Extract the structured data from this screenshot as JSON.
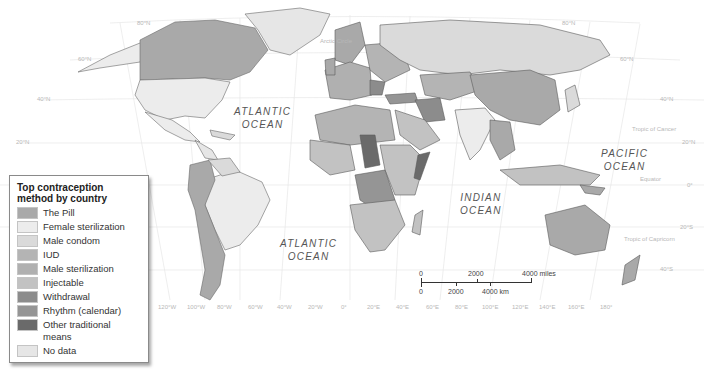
{
  "map": {
    "title": "Top contraception method by country",
    "colors": {
      "the_pill": "#a9a9a9",
      "female_sterilization": "#ececec",
      "male_condom": "#dadada",
      "iud": "#b4b4b4",
      "male_sterilization": "#b0b0b0",
      "injectable": "#c2c2c2",
      "withdrawal": "#8c8c8c",
      "rhythm": "#959595",
      "other_traditional": "#6a6a6a",
      "no_data": "#e6e6e6",
      "border": "#5a5a5a",
      "grid": "#e4e4e4"
    },
    "oceans": [
      {
        "label": "ATLANTIC OCEAN",
        "line1": "ATLANTIC",
        "line2": "OCEAN"
      },
      {
        "label": "ATLANTIC OCEAN",
        "line1": "ATLANTIC",
        "line2": "OCEAN"
      },
      {
        "label": "INDIAN OCEAN",
        "line1": "INDIAN",
        "line2": "OCEAN"
      },
      {
        "label": "PACIFIC OCEAN",
        "line1": "PACIFIC",
        "line2": "OCEAN"
      }
    ],
    "lat_labels": [
      "80°N",
      "60°N",
      "40°N",
      "20°N",
      "20°N",
      "0°",
      "20°S",
      "40°S",
      "80°N",
      "60°N",
      "40°N"
    ],
    "lon_labels": [
      "120°W",
      "100°W",
      "80°W",
      "60°W",
      "40°W",
      "20°W",
      "0°",
      "20°E",
      "40°E",
      "60°E",
      "80°E",
      "100°E",
      "120°E",
      "140°E",
      "160°E",
      "180°"
    ],
    "special_lines": {
      "arctic_circle": "Arctic Circle",
      "tropic_cancer": "Tropic of Cancer",
      "equator": "Equator",
      "tropic_capricorn": "Tropic of Capricorn"
    }
  },
  "legend": {
    "title_line1": "Top contraception",
    "title_line2": "method by country",
    "items": [
      {
        "label": "The Pill",
        "color": "#a9a9a9"
      },
      {
        "label": "Female sterilization",
        "color": "#ececec"
      },
      {
        "label": "Male condom",
        "color": "#dadada"
      },
      {
        "label": "IUD",
        "color": "#b4b4b4"
      },
      {
        "label": "Male sterilization",
        "color": "#b0b0b0"
      },
      {
        "label": "Injectable",
        "color": "#c2c2c2"
      },
      {
        "label": "Withdrawal",
        "color": "#8c8c8c"
      },
      {
        "label": "Rhythm (calendar)",
        "color": "#959595"
      },
      {
        "label": "Other traditional means",
        "color": "#6a6a6a"
      },
      {
        "label": "No data",
        "color": "#e6e6e6"
      }
    ]
  },
  "scale_bar": {
    "miles": {
      "zero": "0",
      "mid": "2000",
      "end": "4000 miles"
    },
    "km": {
      "zero": "0",
      "mid": "2000",
      "end": "4000 km"
    }
  }
}
